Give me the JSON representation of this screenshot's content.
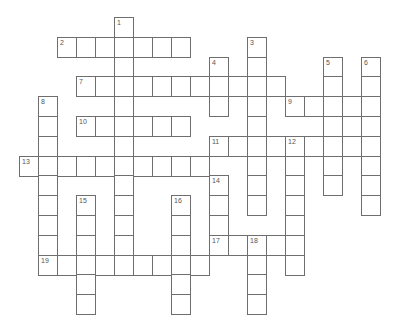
{
  "puzzle": {
    "title": "Crossword grid",
    "grid": {
      "origin_x": 19,
      "origin_y": 17,
      "cell_w": 19,
      "cell_h": 19.8
    },
    "colors": {
      "border": "#6e6e6e",
      "number": "#555555",
      "cell": "#ffffff"
    },
    "words": [
      {
        "number": "1",
        "direction": "down",
        "col": 5,
        "row": 0,
        "length": 13
      },
      {
        "number": "2",
        "direction": "across",
        "col": 2,
        "row": 1,
        "length": 7
      },
      {
        "number": "3",
        "direction": "down",
        "col": 12,
        "row": 1,
        "length": 9
      },
      {
        "number": "4",
        "direction": "down",
        "col": 10,
        "row": 2,
        "length": 3
      },
      {
        "number": "5",
        "direction": "down",
        "col": 16,
        "row": 2,
        "length": 7
      },
      {
        "number": "6",
        "direction": "down",
        "col": 18,
        "row": 2,
        "length": 8
      },
      {
        "number": "7",
        "direction": "across",
        "col": 3,
        "row": 3,
        "length": 11
      },
      {
        "number": "8",
        "direction": "down",
        "col": 1,
        "row": 4,
        "length": 9
      },
      {
        "number": "9",
        "direction": "across",
        "col": 14,
        "row": 4,
        "length": 5
      },
      {
        "number": "",
        "direction": "down",
        "col": 17,
        "row": 4,
        "length": 3
      },
      {
        "number": "10",
        "direction": "across",
        "col": 3,
        "row": 5,
        "length": 6
      },
      {
        "number": "11",
        "direction": "across",
        "col": 10,
        "row": 6,
        "length": 9
      },
      {
        "number": "12",
        "direction": "down",
        "col": 14,
        "row": 6,
        "length": 7
      },
      {
        "number": "13",
        "direction": "across",
        "col": 0,
        "row": 7,
        "length": 10
      },
      {
        "number": "14",
        "direction": "down",
        "col": 10,
        "row": 8,
        "length": 4
      },
      {
        "number": "15",
        "direction": "down",
        "col": 3,
        "row": 9,
        "length": 6
      },
      {
        "number": "16",
        "direction": "down",
        "col": 8,
        "row": 9,
        "length": 6
      },
      {
        "number": "17",
        "direction": "across",
        "col": 10,
        "row": 11,
        "length": 5
      },
      {
        "number": "18",
        "direction": "down",
        "col": 12,
        "row": 11,
        "length": 4
      },
      {
        "number": "19",
        "direction": "across",
        "col": 1,
        "row": 12,
        "length": 9
      }
    ]
  }
}
